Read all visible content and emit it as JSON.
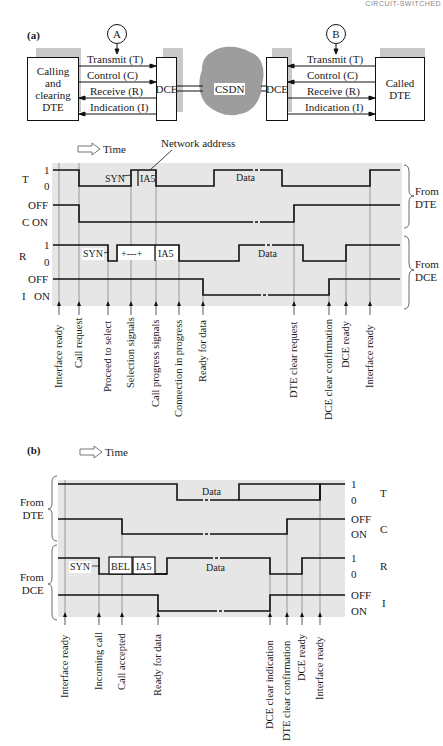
{
  "header": {
    "running_head": "CIRCUIT-SWITCHED"
  },
  "panel_a": {
    "label": "(a)",
    "block_diagram": {
      "left_dte": "Calling\nand\nclearing\nDTE",
      "left_dce": "DCE",
      "network": "CSDN",
      "right_dce": "DCE",
      "right_dte": "Called\nDTE",
      "point_a": "A",
      "point_b": "B",
      "circuits_left": [
        "Transmit (T)",
        "Control (C)",
        "Receive (R)",
        "Indication (I)"
      ],
      "circuits_right": [
        "Transmit (T)",
        "Control (C)",
        "Receive (R)",
        "Indication (I)"
      ]
    },
    "timing": {
      "time_label": "Time",
      "network_address_label": "Network address",
      "signals": [
        {
          "name": "T",
          "levels": [
            "1",
            "0"
          ]
        },
        {
          "name": "C",
          "levels": [
            "OFF",
            "ON"
          ]
        },
        {
          "name": "R",
          "levels": [
            "1",
            "0"
          ]
        },
        {
          "name": "I",
          "levels": [
            "OFF",
            "ON"
          ]
        }
      ],
      "group_labels": [
        "From\nDTE",
        "From\nDCE"
      ],
      "field_labels": {
        "t_syn": "SYN",
        "t_ia5": "IA5",
        "t_data": "Data",
        "r_syn": "SYN",
        "r_plus": "+---+",
        "r_ia5": "IA5",
        "r_data": "Data"
      },
      "events": [
        "Interface ready",
        "Call request",
        "Proceed to select",
        "Selection signals",
        "Call progress signals",
        "Connection in progress",
        "Ready for data",
        "DTE clear request",
        "DCE clear confirmation",
        "DCE ready",
        "Interface ready"
      ]
    }
  },
  "panel_b": {
    "label": "(b)",
    "timing": {
      "time_label": "Time",
      "signals": [
        {
          "name": "T",
          "levels": [
            "1",
            "0"
          ]
        },
        {
          "name": "C",
          "levels": [
            "OFF",
            "ON"
          ]
        },
        {
          "name": "R",
          "levels": [
            "1",
            "0"
          ]
        },
        {
          "name": "I",
          "levels": [
            "OFF",
            "ON"
          ]
        }
      ],
      "group_labels": [
        "From\nDTE",
        "From\nDCE"
      ],
      "field_labels": {
        "t_data": "Data",
        "r_syn": "SYN",
        "r_bel": "BEL",
        "r_ia5": "IA5",
        "r_data": "Data"
      },
      "events": [
        "Interface ready",
        "Incoming call",
        "Call accepted",
        "Ready for data",
        "DCE clear indication",
        "DTE clear confirmation",
        "DCE ready",
        "Interface ready"
      ]
    }
  }
}
